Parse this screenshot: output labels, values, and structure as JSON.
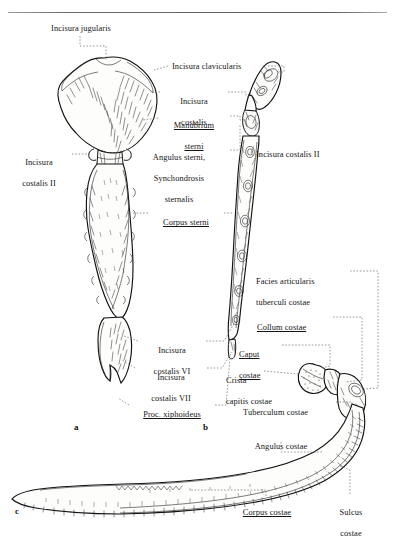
{
  "page": {
    "width": 395,
    "height": 543,
    "background": "#ffffff",
    "ink": "#141414",
    "leader_color": "#6e6e6e",
    "top_rule": true
  },
  "figure_letters": [
    {
      "id": "a",
      "text": "a",
      "x": 74,
      "y": 422,
      "note": "sternum, ventral view"
    },
    {
      "id": "b",
      "text": "b",
      "x": 203,
      "y": 422,
      "note": "sternum, lateral view"
    },
    {
      "id": "c",
      "text": "c",
      "x": 15,
      "y": 506,
      "note": "rib, superior view"
    }
  ],
  "labels": [
    {
      "id": "incisura-jugularis",
      "lines": [
        "Incisura jugularis"
      ],
      "underline": false,
      "align": "center",
      "x": 22,
      "y": 24,
      "width": 118
    },
    {
      "id": "incisura-clavicularis",
      "lines": [
        "Incisura clavicularis"
      ],
      "underline": false,
      "align": "left",
      "x": 172,
      "y": 62,
      "width": 96
    },
    {
      "id": "incisura-costalis",
      "lines": [
        "Incisura",
        "costalis"
      ],
      "underline": false,
      "align": "center",
      "x": 163,
      "y": 87,
      "width": 62
    },
    {
      "id": "manubrium-sterni",
      "lines": [
        "Manubrium",
        "sterni"
      ],
      "underline": true,
      "align": "center",
      "x": 161,
      "y": 111,
      "width": 66
    },
    {
      "id": "angulus-sterni-synchondrosis",
      "lines": [
        "Angulus sterni,",
        "Synchondrosis",
        "sternalis"
      ],
      "underline": false,
      "align": "center",
      "x": 131,
      "y": 143,
      "width": 96
    },
    {
      "id": "incisura-costalis-ii-left",
      "lines": [
        "Incisura",
        "costalis II"
      ],
      "underline": false,
      "align": "center",
      "x": 8,
      "y": 148,
      "width": 62
    },
    {
      "id": "incisura-costalis-ii-right",
      "lines": [
        "Incisura costalis II"
      ],
      "underline": false,
      "align": "left",
      "x": 256,
      "y": 150,
      "width": 98
    },
    {
      "id": "corpus-sterni",
      "lines": [
        "Corpus sterni"
      ],
      "underline": true,
      "align": "center",
      "x": 150,
      "y": 208,
      "width": 72
    },
    {
      "id": "facies-articularis-tuberculi",
      "lines": [
        "Facies articularis",
        "tuberculi costae"
      ],
      "underline": false,
      "align": "left",
      "x": 256,
      "y": 267,
      "width": 92
    },
    {
      "id": "collum-costae",
      "lines": [
        "Collum costae"
      ],
      "underline": true,
      "align": "left",
      "x": 257,
      "y": 313,
      "width": 74
    },
    {
      "id": "caput-costae",
      "lines": [
        "Caput",
        "costae"
      ],
      "underline": true,
      "align": "left",
      "x": 239,
      "y": 340,
      "width": 40
    },
    {
      "id": "crista-capitis-costae",
      "lines": [
        "Crista",
        "capitis costae"
      ],
      "underline": false,
      "align": "left",
      "x": 226,
      "y": 366,
      "width": 70
    },
    {
      "id": "tuberculum-costae",
      "lines": [
        "Tuberculum costae"
      ],
      "underline": false,
      "align": "left",
      "x": 243,
      "y": 398,
      "width": 92
    },
    {
      "id": "incisura-costalis-vi",
      "lines": [
        "Incisura",
        "costalis VI"
      ],
      "underline": false,
      "align": "center",
      "x": 140,
      "y": 336,
      "width": 64
    },
    {
      "id": "incisura-costalis-vii",
      "lines": [
        "Incisura",
        "costalis VII"
      ],
      "underline": false,
      "align": "center",
      "x": 137,
      "y": 363,
      "width": 68
    },
    {
      "id": "proc-xiphoideus",
      "lines": [
        "Proc. xiphoideus"
      ],
      "underline": true,
      "align": "center",
      "x": 131,
      "y": 400,
      "width": 82
    },
    {
      "id": "angulus-costae",
      "lines": [
        "Angulus costae"
      ],
      "underline": false,
      "align": "center",
      "x": 240,
      "y": 432,
      "width": 82
    },
    {
      "id": "corpus-costae",
      "lines": [
        "Corpus costae"
      ],
      "underline": true,
      "align": "center",
      "x": 228,
      "y": 498,
      "width": 78
    },
    {
      "id": "sulcus-costae",
      "lines": [
        "Sulcus",
        "costae"
      ],
      "underline": false,
      "align": "center",
      "x": 327,
      "y": 498,
      "width": 48
    }
  ],
  "diagram": {
    "parts": [
      {
        "id": "sternum-ventral",
        "figure": "a",
        "description": "Sternum seen from the front: manubrium, body, xiphoid process"
      },
      {
        "id": "sternum-lateral",
        "figure": "b",
        "description": "Sternum seen from the side with costal notches"
      },
      {
        "id": "rib-superior",
        "figure": "c",
        "description": "Right rib with head, neck, tubercle, body and costal groove"
      }
    ]
  }
}
